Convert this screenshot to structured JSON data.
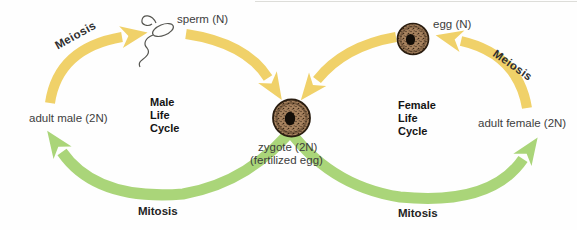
{
  "figure": {
    "type": "life-cycle-diagram",
    "zygote": {
      "label": "zygote (2N)",
      "sublabel": "(fertilized egg)"
    },
    "male_cycle": {
      "title_lines": [
        "Male",
        "Life",
        "Cycle"
      ],
      "adult_label": "adult male (2N)",
      "gamete_label": "sperm (N)",
      "meiosis_label": "Meiosis",
      "mitosis_label": "Mitosis"
    },
    "female_cycle": {
      "title_lines": [
        "Female",
        "Life",
        "Cycle"
      ],
      "adult_label": "adult female (2N)",
      "gamete_label": "egg (N)",
      "meiosis_label": "Meiosis",
      "mitosis_label": "Mitosis"
    }
  },
  "colors": {
    "meiosis_arrow": "#f0d169",
    "mitosis_arrow": "#aad579",
    "cell_body": "#a8835f",
    "cell_speckle": "#43301f",
    "cell_nucleus": "#140e08",
    "cell_outline": "#2a1d10",
    "sperm_outline": "#555550"
  }
}
